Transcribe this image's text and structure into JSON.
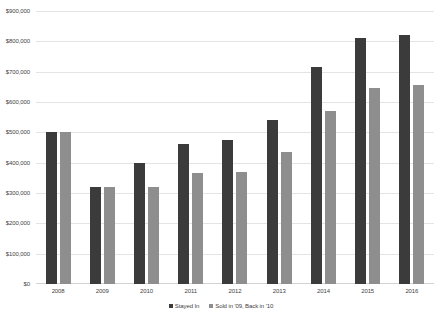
{
  "chart_data": {
    "type": "bar",
    "title": "",
    "xlabel": "",
    "ylabel": "",
    "ylim": [
      0,
      900000
    ],
    "ytick_values": [
      0,
      100000,
      200000,
      300000,
      400000,
      500000,
      600000,
      700000,
      800000,
      900000
    ],
    "ytick_labels": [
      "$0",
      "$100,000",
      "$200,000",
      "$300,000",
      "$400,000",
      "$500,000",
      "$600,000",
      "$700,000",
      "$800,000",
      "$900,000"
    ],
    "grid": true,
    "legend_position": "bottom",
    "categories": [
      "2008",
      "2009",
      "2010",
      "2011",
      "2012",
      "2013",
      "2014",
      "2015",
      "2016"
    ],
    "series": [
      {
        "name": "Stayed In",
        "color": "#3b3b3b",
        "values": [
          500000,
          320000,
          400000,
          460000,
          475000,
          540000,
          715000,
          810000,
          820000
        ]
      },
      {
        "name": "Sold in '09, Back in '10",
        "color": "#8e8e8e",
        "values": [
          500000,
          320000,
          320000,
          365000,
          370000,
          435000,
          570000,
          645000,
          655000
        ]
      }
    ]
  },
  "legend": {
    "items": [
      {
        "label": "Stayed In"
      },
      {
        "label": "Sold in '09, Back in '10"
      }
    ]
  },
  "colors": {
    "series_dark": "#3b3b3b",
    "series_light": "#8e8e8e",
    "gridline": "#e4e4e4",
    "text": "#3f3f3f",
    "background": "#ffffff"
  }
}
